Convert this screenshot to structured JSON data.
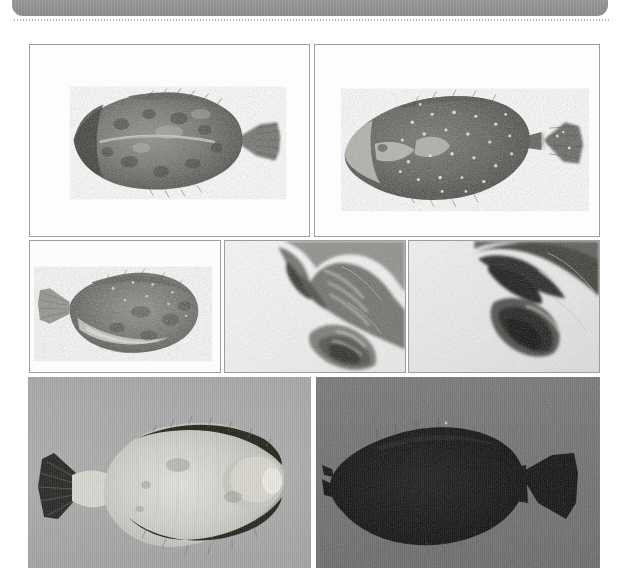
{
  "document": {
    "header": {
      "title": "",
      "bar_color": "#8f8f8f",
      "divider_style": "dotted"
    },
    "page_background": "#ffffff"
  },
  "figure": {
    "name": "flatfish-photo-plate",
    "rows": 3,
    "panels": [
      {
        "id": "panel-a",
        "row": 1,
        "column": 1,
        "caption": "",
        "bordered": true,
        "background": "#ffffff",
        "subject": "flatfish-dorsal-view-dark-mottled",
        "description": "Whole flatfish, eyed side up, head to left, mottled dark grey skin, fan-shaped caudal fin at right",
        "x": 29,
        "y": 44,
        "width": 281,
        "height": 193
      },
      {
        "id": "panel-b",
        "row": 1,
        "column": 2,
        "caption": "",
        "bordered": true,
        "background": "#ffffff",
        "subject": "flatfish-speckled-white-spots",
        "description": "Whole flatfish with pale speckles over dark skin, head to left, tail fin at right",
        "x": 314,
        "y": 44,
        "width": 286,
        "height": 193
      },
      {
        "id": "panel-c",
        "row": 2,
        "column": 1,
        "caption": "",
        "bordered": true,
        "background": "#ffffff",
        "subject": "flatfish-tail-left-orientation",
        "description": "Whole flatfish with caudal fin at left and head to right, grainy grey skin",
        "x": 29,
        "y": 240,
        "width": 192,
        "height": 133
      },
      {
        "id": "panel-d",
        "row": 2,
        "column": 2,
        "caption": "",
        "bordered": true,
        "background": "#f2f2f2",
        "subject": "fish-head-closeup-detail",
        "description": "Close-up macro detail of fish head and mouth region against pale background",
        "x": 224,
        "y": 240,
        "width": 182,
        "height": 133
      },
      {
        "id": "panel-e",
        "row": 2,
        "column": 3,
        "caption": "",
        "bordered": true,
        "background": "#ededed",
        "subject": "fish-jaw-closeup-detail",
        "description": "Close-up macro detail of dark jaw and gill structures against pale grey background",
        "x": 408,
        "y": 240,
        "width": 192,
        "height": 133
      },
      {
        "id": "panel-f",
        "row": 3,
        "column": 1,
        "caption": "",
        "bordered": false,
        "background": "#a9a9a9",
        "subject": "flatfish-blind-side-pale",
        "description": "Whole flatfish blind (pale) side up on grey board, dark dorsal and anal fin margins, tail at left",
        "x": 28,
        "y": 377,
        "width": 283,
        "height": 191
      },
      {
        "id": "panel-g",
        "row": 3,
        "column": 2,
        "caption": "",
        "bordered": false,
        "background": "#6f6f6f",
        "subject": "flatfish-silhouette-black",
        "description": "Whole flatfish appearing almost black in silhouette on grey board, head to left, tail at right",
        "x": 316,
        "y": 377,
        "width": 284,
        "height": 191
      }
    ]
  }
}
